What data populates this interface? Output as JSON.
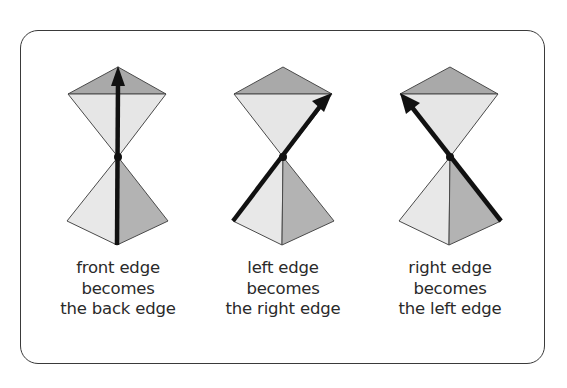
{
  "colors": {
    "outline": "#4a4a4a",
    "light_face": "#e8e8e8",
    "dark_face": "#b5b5b5",
    "back_face": "#a8a8a8",
    "arrow": "#111111",
    "text": "#2a2a2a"
  },
  "panels": [
    {
      "id": "front-to-back",
      "caption": [
        "front edge",
        "becomes",
        "the back edge"
      ]
    },
    {
      "id": "left-to-right",
      "caption": [
        "left edge",
        "becomes",
        "the right edge"
      ]
    },
    {
      "id": "right-to-left",
      "caption": [
        "right edge",
        "becomes",
        "the left edge"
      ]
    }
  ]
}
